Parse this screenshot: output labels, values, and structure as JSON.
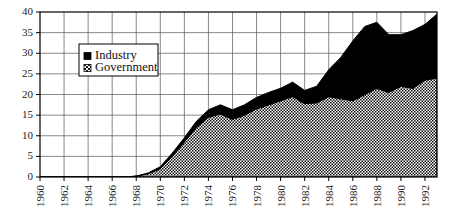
{
  "chart_data": {
    "type": "area",
    "stacked": true,
    "title": "",
    "subtitle": "",
    "xlabel": "",
    "ylabel": "",
    "xlim": [
      1960,
      1993
    ],
    "ylim": [
      0,
      40
    ],
    "grid": true,
    "legend_position": "upper-left-inside",
    "x": [
      1960,
      1961,
      1962,
      1963,
      1964,
      1965,
      1966,
      1967,
      1968,
      1969,
      1970,
      1971,
      1972,
      1973,
      1974,
      1975,
      1976,
      1977,
      1978,
      1979,
      1980,
      1981,
      1982,
      1983,
      1984,
      1985,
      1986,
      1987,
      1988,
      1989,
      1990,
      1991,
      1992,
      1993
    ],
    "series": [
      {
        "name": "Government",
        "fill": "checkerboard",
        "values": [
          0,
          0,
          0,
          0,
          0,
          0,
          0,
          0,
          0.2,
          0.8,
          2.0,
          5.0,
          8.5,
          12.0,
          14.5,
          15.3,
          14.0,
          15.0,
          16.5,
          17.5,
          18.5,
          19.5,
          17.8,
          18.0,
          19.5,
          19.0,
          18.5,
          20.0,
          21.5,
          20.5,
          22.0,
          21.5,
          23.5,
          24.0
        ]
      },
      {
        "name": "Industry",
        "fill": "solid-black",
        "values": [
          0,
          0,
          0,
          0,
          0,
          0,
          0,
          0,
          0,
          0.2,
          0.5,
          0.8,
          1.0,
          1.5,
          1.8,
          2.2,
          2.3,
          2.5,
          2.8,
          3.0,
          3.0,
          3.5,
          3.2,
          4.0,
          6.5,
          10.0,
          14.5,
          16.5,
          16.0,
          14.0,
          12.5,
          14.0,
          13.5,
          15.5
        ]
      }
    ],
    "totals": [
      0,
      0,
      0,
      0,
      0,
      0,
      0,
      0,
      0.2,
      1.0,
      2.5,
      5.8,
      9.5,
      13.5,
      16.3,
      17.5,
      16.3,
      17.5,
      19.3,
      20.5,
      21.5,
      23.0,
      21.0,
      22.0,
      26.0,
      29.0,
      33.0,
      36.5,
      37.5,
      34.5,
      34.5,
      35.5,
      37.0,
      39.5
    ],
    "ytick_labels": [
      "0",
      "5",
      "10",
      "15",
      "20",
      "25",
      "30",
      "35",
      "40"
    ],
    "ytick_values": [
      0,
      5,
      10,
      15,
      20,
      25,
      30,
      35,
      40
    ],
    "xtick_labels": [
      "1960",
      "1962",
      "1964",
      "1966",
      "1968",
      "1970",
      "1972",
      "1974",
      "1976",
      "1978",
      "1980",
      "1982",
      "1984",
      "1986",
      "1988",
      "1990",
      "1992"
    ],
    "xtick_values": [
      1960,
      1962,
      1964,
      1966,
      1968,
      1970,
      1972,
      1974,
      1976,
      1978,
      1980,
      1982,
      1984,
      1986,
      1988,
      1990,
      1992
    ],
    "legend": [
      {
        "label": "Industry",
        "swatch": "solid-black"
      },
      {
        "label": "Government",
        "swatch": "checkerboard"
      }
    ],
    "colors": {
      "industry": "#000000",
      "government_base": "#ffffff",
      "government_pattern": "#111111",
      "axis": "#000000",
      "grid": "#555555",
      "background": "#ffffff"
    }
  }
}
